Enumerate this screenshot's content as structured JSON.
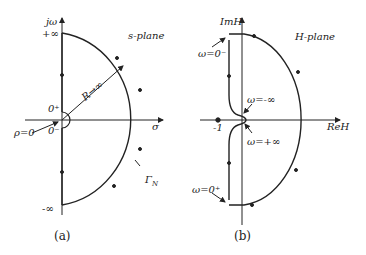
{
  "panel_a": {
    "title": "s-plane",
    "y_axis": "jω",
    "x_axis": "σ",
    "plus_inf": "+∞",
    "minus_inf": "-∞",
    "zero_plus": "0⁺",
    "zero_minus": "0⁻",
    "rho": "ρ=0",
    "radius": "R→∞",
    "contour": "Γ",
    "contour_sub": "N",
    "caption": "(a)"
  },
  "panel_b": {
    "title": "H-plane",
    "y_axis": "ImH",
    "x_axis": "ReH",
    "minus_one": "-1",
    "w_zero_minus": "ω=0⁻",
    "w_zero_plus": "ω=0⁺",
    "w_minus_inf": "ω=-∞",
    "w_plus_inf": "ω=+∞",
    "caption": "(b)"
  }
}
